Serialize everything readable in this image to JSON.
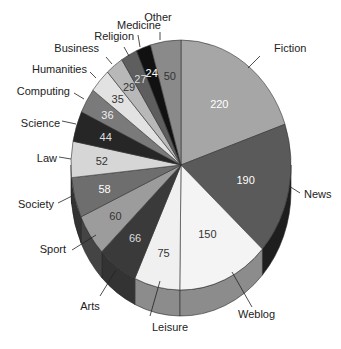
{
  "chart_data": {
    "type": "pie",
    "style": "3d-exploded-free",
    "title": "",
    "start_angle_deg": 0,
    "direction": "clockwise",
    "categories": [
      "Fiction",
      "News",
      "Weblog",
      "Leisure",
      "Arts",
      "Sport",
      "Society",
      "Law",
      "Science",
      "Computing",
      "Humanities",
      "Business",
      "Religion",
      "Medicine",
      "Other"
    ],
    "values": [
      220,
      190,
      150,
      75,
      66,
      60,
      58,
      52,
      44,
      36,
      35,
      29,
      27,
      24,
      50
    ],
    "slices": [
      {
        "label": "Fiction",
        "value": 220,
        "color": "#a6a6a6",
        "side": "#8a8a8a",
        "text": "#ffffff"
      },
      {
        "label": "News",
        "value": 190,
        "color": "#5a5a5a",
        "side": "#1e1e1e",
        "text": "#ffffff"
      },
      {
        "label": "Weblog",
        "value": 150,
        "color": "#f4f4f4",
        "side": "#8c8c8c",
        "text": "#333333"
      },
      {
        "label": "Leisure",
        "value": 75,
        "color": "#f0f0f0",
        "side": "#8c8c8c",
        "text": "#333333"
      },
      {
        "label": "Arts",
        "value": 66,
        "color": "#3a3a3a",
        "side": "#333333",
        "text": "#dddddd"
      },
      {
        "label": "Sport",
        "value": 60,
        "color": "#9c9c9c",
        "side": "#444444",
        "text": "#333333"
      },
      {
        "label": "Society",
        "value": 58,
        "color": "#6e6e6e",
        "side": "#333333",
        "text": "#ffffff"
      },
      {
        "label": "Law",
        "value": 52,
        "color": "#d6d6d6",
        "side": "#333333",
        "text": "#333333"
      },
      {
        "label": "Science",
        "value": 44,
        "color": "#262626",
        "side": "#222222",
        "text": "#dddddd"
      },
      {
        "label": "Computing",
        "value": 36,
        "color": "#7a7a7a",
        "side": "#333333",
        "text": "#eeeeee"
      },
      {
        "label": "Humanities",
        "value": 35,
        "color": "#e2e2e2",
        "side": "#333333",
        "text": "#333333"
      },
      {
        "label": "Business",
        "value": 29,
        "color": "#b8b8b8",
        "side": "#333333",
        "text": "#333333"
      },
      {
        "label": "Religion",
        "value": 27,
        "color": "#5e5e5e",
        "side": "#333333",
        "text": "#dddddd"
      },
      {
        "label": "Medicine",
        "value": 24,
        "color": "#111111",
        "side": "#111111",
        "text": "#ffffff"
      },
      {
        "label": "Other",
        "value": 50,
        "color": "#8a8a8a",
        "side": "#555555",
        "text": "#333333"
      }
    ],
    "outer_labels": [
      {
        "label": "Fiction",
        "x": 274,
        "y": 52,
        "anchor": "start",
        "lx1": 248,
        "ly1": 68,
        "lx2": 260,
        "ly2": 56
      },
      {
        "label": "News",
        "x": 304,
        "y": 198,
        "anchor": "start",
        "lx1": 289,
        "ly1": 186,
        "lx2": 300,
        "ly2": 193
      },
      {
        "label": "Weblog",
        "x": 238,
        "y": 318,
        "anchor": "start",
        "lx1": 232,
        "ly1": 272,
        "lx2": 252,
        "ly2": 307
      },
      {
        "label": "Leisure",
        "x": 170,
        "y": 331,
        "anchor": "middle",
        "lx1": 160,
        "ly1": 281,
        "lx2": 150,
        "ly2": 316
      },
      {
        "label": "Arts",
        "x": 90,
        "y": 310,
        "anchor": "middle",
        "lx1": 116,
        "ly1": 270,
        "lx2": 100,
        "ly2": 296
      },
      {
        "label": "Sport",
        "x": 66,
        "y": 253,
        "anchor": "end",
        "lx1": 96,
        "ly1": 235,
        "lx2": 72,
        "ly2": 250
      },
      {
        "label": "Society",
        "x": 54,
        "y": 208,
        "anchor": "end",
        "lx1": 72,
        "ly1": 196,
        "lx2": 58,
        "ly2": 203
      },
      {
        "label": "Law",
        "x": 57,
        "y": 162,
        "anchor": "end",
        "lx1": 71,
        "ly1": 159,
        "lx2": 59,
        "ly2": 157
      },
      {
        "label": "Science",
        "x": 60,
        "y": 127,
        "anchor": "end",
        "lx1": 76,
        "ly1": 124,
        "lx2": 62,
        "ly2": 121
      },
      {
        "label": "Computing",
        "x": 70,
        "y": 95,
        "anchor": "end",
        "lx1": 84,
        "ly1": 99,
        "lx2": 74,
        "ly2": 93
      },
      {
        "label": "Humanities",
        "x": 87,
        "y": 73,
        "anchor": "end",
        "lx1": 96,
        "ly1": 78,
        "lx2": 90,
        "ly2": 72
      },
      {
        "label": "Business",
        "x": 99,
        "y": 52,
        "anchor": "end",
        "lx1": 112,
        "ly1": 64,
        "lx2": 106,
        "ly2": 57
      },
      {
        "label": "Religion",
        "x": 134,
        "y": 40,
        "anchor": "end",
        "lx1": 129,
        "ly1": 56,
        "lx2": 124,
        "ly2": 47
      },
      {
        "label": "Medicine",
        "x": 161,
        "y": 29,
        "anchor": "end",
        "lx1": 140,
        "ly1": 47,
        "lx2": 138,
        "ly2": 35
      },
      {
        "label": "Other",
        "x": 158,
        "y": 21,
        "anchor": "middle",
        "lx1": 160,
        "ly1": 40,
        "lx2": 160,
        "ly2": 32
      }
    ],
    "geometry": {
      "cx": 181,
      "cy": 165,
      "rx": 110,
      "ry": 125,
      "depth": 26,
      "label_r": 0.68
    }
  }
}
